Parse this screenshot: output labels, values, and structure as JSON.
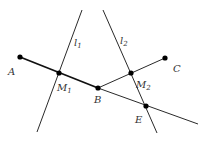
{
  "diagram": {
    "colors": {
      "line": "#2a2a2a",
      "point": "#000000",
      "label": "#333333"
    },
    "points": {
      "A": {
        "label": "A",
        "x": 20,
        "y": 57
      },
      "M1": {
        "label": "M",
        "sub": "1",
        "x": 59,
        "y": 73
      },
      "B": {
        "label": "B",
        "x": 98,
        "y": 88
      },
      "M2": {
        "label": "M",
        "sub": "2",
        "x": 131,
        "y": 73
      },
      "C": {
        "label": "C",
        "x": 165,
        "y": 58
      },
      "E": {
        "label": "E",
        "x": 146,
        "y": 106
      }
    },
    "lines": {
      "l1": {
        "label": "l",
        "sub": "1"
      },
      "l2": {
        "label": "l",
        "sub": "2"
      }
    }
  }
}
